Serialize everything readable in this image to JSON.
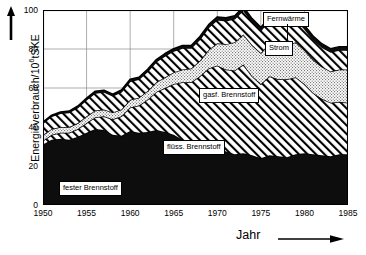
{
  "axes": {
    "ylabel": "Energieverbrauch/10",
    "ylabel_exp": "6",
    "ylabel_unit": "tSKE",
    "xlabel": "Jahr",
    "yticks": [
      0,
      20,
      40,
      60,
      80,
      100
    ],
    "xticks": [
      1950,
      1955,
      1960,
      1965,
      1970,
      1975,
      1980,
      1985
    ]
  },
  "callouts": {
    "fernwaerme": "Fernwärme",
    "strom": "Strom",
    "gasf": "gasf. Brennstoff",
    "fluess": "flüss. Brennstoff",
    "fester": "fester Brennstoff"
  },
  "colors": {
    "fester": "#0d0d0d",
    "fluess": "#ffffff",
    "gasf": "#e8e8e8",
    "strom": "#ffffff",
    "fernwaerme": "#0d0d0d",
    "axis": "#000000",
    "grid": "#8a8a8a"
  },
  "chart_data": {
    "type": "area",
    "title": "",
    "xlabel": "Jahr",
    "ylabel": "Energieverbrauch/10^6 tSKE",
    "xlim": [
      1950,
      1985
    ],
    "ylim": [
      0,
      100
    ],
    "grid": true,
    "stacked": true,
    "legend": "inline-callouts",
    "x": [
      1950,
      1951,
      1952,
      1953,
      1954,
      1955,
      1956,
      1957,
      1958,
      1959,
      1960,
      1961,
      1962,
      1963,
      1964,
      1965,
      1966,
      1967,
      1968,
      1969,
      1970,
      1971,
      1972,
      1973,
      1974,
      1975,
      1976,
      1977,
      1978,
      1979,
      1980,
      1981,
      1982,
      1983,
      1984,
      1985
    ],
    "series": [
      {
        "name": "fester Brennstoff",
        "pattern": "solid-black",
        "values": [
          31.0,
          33.5,
          34.0,
          33.5,
          35.0,
          37.0,
          39.0,
          38.5,
          36.0,
          35.5,
          38.0,
          37.0,
          37.5,
          38.5,
          37.5,
          36.0,
          33.5,
          31.0,
          30.5,
          31.0,
          30.5,
          27.5,
          26.0,
          26.5,
          25.5,
          24.0,
          25.5,
          25.0,
          24.5,
          26.0,
          26.5,
          26.0,
          25.5,
          25.0,
          26.0,
          26.0
        ]
      },
      {
        "name": "flüss. Brennstoff",
        "pattern": "diagonal-hatch",
        "values": [
          2.0,
          2.5,
          3.0,
          3.5,
          4.0,
          5.0,
          6.0,
          7.0,
          8.0,
          10.0,
          12.0,
          14.0,
          16.5,
          19.5,
          22.5,
          26.0,
          29.5,
          32.0,
          35.5,
          39.0,
          41.0,
          42.0,
          43.0,
          45.5,
          40.5,
          38.0,
          40.5,
          39.5,
          40.0,
          39.5,
          35.5,
          31.5,
          29.0,
          27.5,
          27.0,
          26.5
        ]
      },
      {
        "name": "gasf. Brennstoff",
        "pattern": "stipple",
        "values": [
          3.0,
          3.0,
          3.0,
          3.0,
          3.0,
          3.5,
          3.5,
          3.5,
          3.5,
          3.5,
          4.0,
          4.0,
          4.5,
          5.0,
          5.5,
          6.0,
          6.5,
          7.0,
          8.0,
          9.5,
          11.5,
          13.0,
          14.5,
          15.5,
          16.0,
          16.0,
          17.0,
          17.0,
          17.5,
          18.0,
          17.5,
          17.0,
          16.5,
          16.0,
          16.5,
          17.0
        ]
      },
      {
        "name": "Strom",
        "pattern": "diagonal-hatch",
        "values": [
          6.0,
          6.5,
          7.0,
          7.5,
          8.0,
          8.5,
          9.0,
          9.0,
          8.5,
          9.0,
          9.5,
          9.5,
          10.0,
          10.5,
          11.0,
          11.0,
          11.0,
          10.5,
          11.0,
          11.5,
          12.0,
          12.0,
          12.0,
          12.5,
          12.0,
          11.5,
          12.0,
          11.5,
          11.5,
          11.5,
          11.0,
          10.5,
          10.0,
          10.0,
          10.0,
          10.0
        ]
      },
      {
        "name": "Fernwärme",
        "pattern": "solid-black-thin",
        "values": [
          0.6,
          0.6,
          0.7,
          0.7,
          0.8,
          0.8,
          0.9,
          0.9,
          0.9,
          1.0,
          1.0,
          1.0,
          1.1,
          1.1,
          1.2,
          1.2,
          1.3,
          1.3,
          1.4,
          1.5,
          1.5,
          1.5,
          1.6,
          1.6,
          1.6,
          1.6,
          1.7,
          1.7,
          1.7,
          1.7,
          1.7,
          1.7,
          1.7,
          1.7,
          1.7,
          1.7
        ]
      }
    ]
  }
}
